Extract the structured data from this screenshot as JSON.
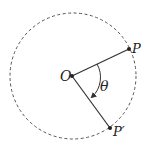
{
  "diagram": {
    "type": "rotation-geometry",
    "circle": {
      "cx": 73,
      "cy": 76,
      "r": 63,
      "style": "dashed",
      "color": "#444444"
    },
    "points": {
      "center": {
        "label": "O",
        "x": 72,
        "y": 76
      },
      "p": {
        "label": "P",
        "x": 129,
        "y": 49
      },
      "p_prime": {
        "label": "P′",
        "x": 110,
        "y": 128
      }
    },
    "angle": {
      "label": "θ",
      "direction": "clockwise"
    },
    "colors": {
      "stroke": "#333333",
      "text": "#222222"
    }
  }
}
